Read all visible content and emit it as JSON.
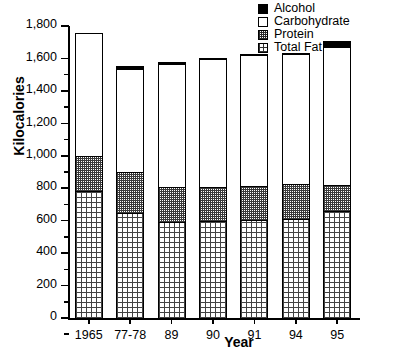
{
  "chart_data": {
    "type": "bar",
    "subtype": "stacked-vertical",
    "title": "Kilocalories by Year",
    "title_visible": false,
    "xlabel": "Year",
    "ylabel": "Kilocalories",
    "categories": [
      "1965",
      "77-78",
      "89",
      "90",
      "91",
      "94",
      "95"
    ],
    "ylim": [
      0,
      1800
    ],
    "yticks": [
      0,
      200,
      400,
      600,
      800,
      1000,
      1200,
      1400,
      1600,
      1800
    ],
    "ytick_labels": [
      "0",
      "200",
      "400",
      "600",
      "800",
      "1,000",
      "1,200",
      "1,400",
      "1,600",
      "1,800"
    ],
    "minor_ticks": true,
    "grid": false,
    "legend_position": "top-right",
    "stack_order_bottom_to_top": [
      "Total Fat",
      "Protein",
      "Carbohydrate",
      "Alcohol"
    ],
    "series": [
      {
        "name": "Total Fat",
        "values": [
          780,
          650,
          590,
          600,
          605,
          610,
          660
        ]
      },
      {
        "name": "Protein",
        "values": [
          220,
          250,
          220,
          210,
          210,
          215,
          160
        ]
      },
      {
        "name": "Carbohydrate",
        "values": [
          748,
          630,
          750,
          780,
          800,
          795,
          845
        ]
      },
      {
        "name": "Alcohol",
        "values": [
          7,
          25,
          20,
          10,
          10,
          15,
          45
        ]
      }
    ],
    "totals": [
      1755,
      1555,
      1580,
      1600,
      1625,
      1635,
      1710
    ]
  },
  "legend": {
    "items": [
      {
        "label": "Alcohol",
        "swatch": "solid-black"
      },
      {
        "label": "Carbohydrate",
        "swatch": "empty-white"
      },
      {
        "label": "Protein",
        "swatch": "dense-checker"
      },
      {
        "label": "Total Fat",
        "swatch": "sparse-dots"
      }
    ]
  },
  "colors": {
    "axis": "#000000",
    "alcohol": "#000000",
    "carbohydrate": "#ffffff",
    "protein_pattern": "#3a3a3a",
    "fat_pattern": "#444444",
    "background": "#ffffff"
  }
}
